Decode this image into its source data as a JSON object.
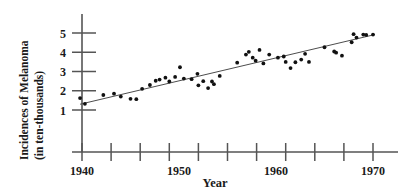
{
  "chart_data": {
    "type": "scatter",
    "title": "",
    "xlabel": "Year",
    "ylabel_line1": "Incidences of Melanoma",
    "ylabel_line2": "(in ten-thousands)",
    "xlim": [
      1939,
      1971
    ],
    "ylim": [
      0.6,
      5.6
    ],
    "grid": false,
    "legend": null,
    "x_tick_labels": [
      "1940",
      "1950",
      "1960",
      "1970"
    ],
    "x_tick_label_values": [
      1940,
      1950,
      1960,
      1970
    ],
    "x_minor_ticks": [
      1940,
      1943,
      1946,
      1949,
      1952,
      1955,
      1958,
      1961,
      1964,
      1967,
      1970
    ],
    "y_tick_labels": [
      "1",
      "2",
      "3",
      "4",
      "5"
    ],
    "y_tick_values": [
      1,
      2,
      3,
      4,
      5
    ],
    "series": [
      {
        "name": "Melanoma incidences",
        "marker": "dot",
        "color": "#111111",
        "points": [
          [
            1939.8,
            1.62
          ],
          [
            1940.3,
            1.32
          ],
          [
            1942.2,
            1.78
          ],
          [
            1943.3,
            1.85
          ],
          [
            1944.0,
            1.7
          ],
          [
            1945.0,
            1.58
          ],
          [
            1945.6,
            1.56
          ],
          [
            1946.2,
            2.1
          ],
          [
            1947.0,
            2.3
          ],
          [
            1947.6,
            2.52
          ],
          [
            1948.0,
            2.58
          ],
          [
            1948.6,
            2.68
          ],
          [
            1949.0,
            2.48
          ],
          [
            1949.6,
            2.72
          ],
          [
            1950.1,
            3.22
          ],
          [
            1950.5,
            2.63
          ],
          [
            1951.3,
            2.6
          ],
          [
            1951.9,
            2.88
          ],
          [
            1952.0,
            2.28
          ],
          [
            1952.5,
            2.5
          ],
          [
            1953.0,
            2.14
          ],
          [
            1953.4,
            2.48
          ],
          [
            1953.6,
            2.34
          ],
          [
            1954.2,
            2.77
          ],
          [
            1956.0,
            3.46
          ],
          [
            1956.9,
            3.88
          ],
          [
            1957.2,
            4.02
          ],
          [
            1957.6,
            3.72
          ],
          [
            1957.9,
            3.56
          ],
          [
            1958.3,
            4.12
          ],
          [
            1958.7,
            3.42
          ],
          [
            1959.3,
            3.88
          ],
          [
            1960.2,
            3.72
          ],
          [
            1960.8,
            3.78
          ],
          [
            1961.0,
            3.5
          ],
          [
            1961.5,
            3.18
          ],
          [
            1962.0,
            3.48
          ],
          [
            1962.6,
            3.62
          ],
          [
            1963.0,
            3.92
          ],
          [
            1963.4,
            3.5
          ],
          [
            1965.0,
            4.26
          ],
          [
            1966.0,
            4.04
          ],
          [
            1966.2,
            3.98
          ],
          [
            1966.8,
            3.82
          ],
          [
            1967.8,
            4.52
          ],
          [
            1968.0,
            4.94
          ],
          [
            1968.3,
            4.76
          ],
          [
            1969.0,
            4.92
          ],
          [
            1969.3,
            4.9
          ],
          [
            1970.0,
            4.92
          ]
        ]
      }
    ],
    "trend_line": {
      "name": "least-squares regression line",
      "color": "#4d4d4d",
      "x_start": 1939.8,
      "y_start": 1.3,
      "x_end": 1970.2,
      "y_end": 4.92
    }
  }
}
